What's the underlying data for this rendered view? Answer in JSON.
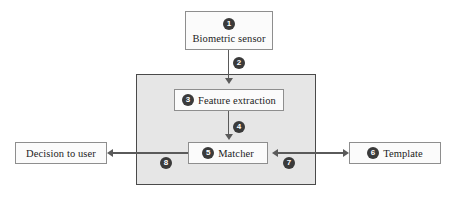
{
  "diagram": {
    "colors": {
      "panel_fill": "#e6e6e6",
      "panel_border": "#4a4a4a",
      "box_fill": "#fbfbfb",
      "box_border": "#8e8e8e",
      "badge_fill": "#3a3a3a",
      "badge_text": "#ffffff",
      "line": "#5a5a5a",
      "background": "#ffffff"
    },
    "nodes": {
      "sensor": {
        "label": "Biometric sensor",
        "badge": "1"
      },
      "feature_extraction": {
        "label": "Feature extraction",
        "badge": "3"
      },
      "matcher": {
        "label": "Matcher",
        "badge": "5"
      },
      "template": {
        "label": "Template",
        "badge": "6"
      },
      "decision": {
        "label": "Decision to user",
        "badge": ""
      }
    },
    "edge_badges": {
      "sensor_to_panel": "2",
      "feature_to_matcher": "4",
      "template_to_matcher": "7",
      "matcher_to_decision": "8"
    }
  }
}
